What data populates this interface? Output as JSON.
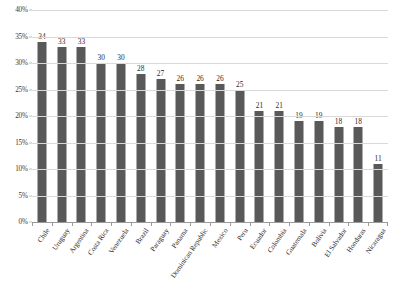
{
  "chart_data": {
    "type": "bar",
    "title": "",
    "subtitle": "",
    "xlabel": "",
    "ylabel": "",
    "ylim": [
      0,
      40
    ],
    "ytick_labels": [
      "0%",
      "5%",
      "10%",
      "15%",
      "20%",
      "25%",
      "30%",
      "35%",
      "40%"
    ],
    "ytick_values": [
      0,
      5,
      10,
      15,
      20,
      25,
      30,
      35,
      40
    ],
    "grid": true,
    "legend": false,
    "legend_position": "none",
    "value_labels_shown": true,
    "categories": [
      "Chile",
      "Uruguay",
      "Argentina",
      "Costa Rica",
      "Venezuela",
      "Brazil",
      "Paraguay",
      "Panama",
      "Dominican Republic",
      "Mexico",
      "Peru",
      "Ecuador",
      "Colombia",
      "Guatemala",
      "Bolivia",
      "El Salvador",
      "Honduras",
      "Nicaragua"
    ],
    "values": [
      34,
      33,
      33,
      30,
      30,
      28,
      27,
      26,
      26,
      26,
      25,
      21,
      21,
      19,
      19,
      18,
      18,
      11
    ],
    "bar_color": "#595959",
    "gridline_color": "#d9d9d9",
    "axis_color": "#9a9a9a",
    "background_color": "#ffffff"
  }
}
